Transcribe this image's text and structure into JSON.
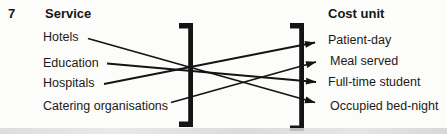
{
  "question_number": "7",
  "left_column": {
    "header": "Service",
    "items": [
      "Hotels",
      "Education",
      "Hospitals",
      "Catering organisations"
    ]
  },
  "right_column": {
    "header": "Cost unit",
    "items": [
      "Patient-day",
      "Meal served",
      "Full-time student",
      "Occupied bed-night"
    ]
  },
  "connections": [
    {
      "from": "Hotels",
      "to": "Occupied bed-night"
    },
    {
      "from": "Education",
      "to": "Full-time student"
    },
    {
      "from": "Hospitals",
      "to": "Patient-day"
    },
    {
      "from": "Catering organisations",
      "to": "Meal served"
    }
  ],
  "colors": {
    "ink": "#141414",
    "background": "#fcfcfa"
  }
}
